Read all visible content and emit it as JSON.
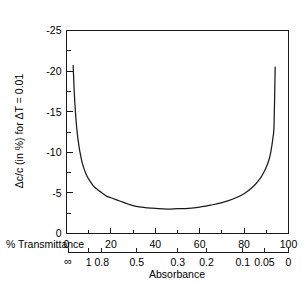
{
  "chart_data": {
    "type": "line",
    "title": "",
    "ylabel": "Δc/c (in %) for ΔT = 0.01",
    "xlabel_primary": "% Transmittance",
    "xlabel_secondary": "Absorbance",
    "ylim": [
      -25,
      0
    ],
    "xlim": [
      0,
      100
    ],
    "grid": false,
    "legend": "none",
    "y_ticks": [
      "-25",
      "-20",
      "-15",
      "-10",
      "-5",
      "0"
    ],
    "y_tick_values": [
      -25,
      -20,
      -15,
      -10,
      -5,
      0
    ],
    "y_minor_values": [
      -22.5,
      -17.5,
      -12.5,
      -7.5,
      -2.5
    ],
    "x_ticks_transmittance": [
      "0",
      "20",
      "40",
      "60",
      "80",
      "100"
    ],
    "x_tick_values_transmittance": [
      0,
      20,
      40,
      60,
      80,
      100
    ],
    "x_minor_values_transmittance": [
      10,
      30,
      50,
      70,
      90
    ],
    "x_ticks_absorbance": [
      "∞",
      "1",
      "0.8",
      "0.5",
      "0.3",
      "0.2",
      "0.1",
      "0.05",
      "0"
    ],
    "x_tick_transmittance_for_absorbance": [
      0.8,
      10,
      15.85,
      31.62,
      50.12,
      63.1,
      79.43,
      89.13,
      100
    ],
    "series": [
      {
        "name": "relative concentration error",
        "x": [
          3.0,
          3.5,
          4.0,
          4.5,
          5.0,
          5.5,
          6.0,
          7.0,
          8.0,
          9.0,
          10.0,
          12.0,
          14.0,
          16.0,
          18.0,
          20.0,
          24.0,
          28.0,
          32.0,
          36.8,
          40.0,
          45.0,
          50.0,
          55.0,
          60.0,
          65.0,
          70.0,
          75.0,
          80.0,
          84.0,
          87.0,
          89.0,
          90.0,
          91.0,
          92.0,
          93.0,
          93.5,
          94.0
        ],
        "y": [
          -20.7,
          -17.4,
          -15.1,
          -13.3,
          -12.0,
          -11.0,
          -10.1,
          -8.8,
          -7.9,
          -7.2,
          -6.7,
          -5.9,
          -5.4,
          -5.0,
          -4.6,
          -4.4,
          -4.0,
          -3.6,
          -3.3,
          -3.15,
          -3.1,
          -3.0,
          -3.05,
          -3.1,
          -3.25,
          -3.5,
          -3.8,
          -4.25,
          -4.9,
          -5.75,
          -6.7,
          -7.6,
          -8.2,
          -8.9,
          -10.0,
          -11.8,
          -13.5,
          -20.5
        ]
      }
    ]
  },
  "figure": {
    "y_axis_title": "Δc/c (in %) for ΔT = 0.01",
    "x_axis_title_primary": "% Transmittance",
    "x_axis_title_secondary": "Absorbance"
  }
}
